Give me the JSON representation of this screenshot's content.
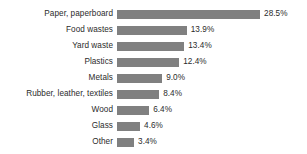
{
  "chart_data": {
    "type": "bar",
    "orientation": "horizontal",
    "title": "",
    "subtitle": "",
    "xlabel": "",
    "ylabel": "",
    "grid": false,
    "legend": null,
    "axis_visible": false,
    "xlim": [
      0,
      28.5
    ],
    "unit": "%",
    "bar_color": "#808080",
    "text_color": "#2b2b2b",
    "background": "#ffffff",
    "categories": [
      "Paper, paperboard",
      "Food wastes",
      "Yard waste",
      "Plastics",
      "Metals",
      "Rubber, leather, textiles",
      "Wood",
      "Glass",
      "Other"
    ],
    "values": [
      28.5,
      13.9,
      13.4,
      12.4,
      9.0,
      8.4,
      6.4,
      4.6,
      3.4
    ],
    "value_labels": [
      "28.5%",
      "13.9%",
      "13.4%",
      "12.4%",
      "9.0%",
      "8.4%",
      "6.4%",
      "4.6%",
      "3.4%"
    ],
    "bars": [
      {
        "label": "Paper, paperboard",
        "value": 28.5,
        "value_label": "28.5%"
      },
      {
        "label": "Food wastes",
        "value": 13.9,
        "value_label": "13.9%"
      },
      {
        "label": "Yard waste",
        "value": 13.4,
        "value_label": "13.4%"
      },
      {
        "label": "Plastics",
        "value": 12.4,
        "value_label": "12.4%"
      },
      {
        "label": "Metals",
        "value": 9.0,
        "value_label": "9.0%"
      },
      {
        "label": "Rubber, leather, textiles",
        "value": 8.4,
        "value_label": "8.4%"
      },
      {
        "label": "Wood",
        "value": 6.4,
        "value_label": "6.4%"
      },
      {
        "label": "Glass",
        "value": 4.6,
        "value_label": "4.6%"
      },
      {
        "label": "Other",
        "value": 3.4,
        "value_label": "3.4%"
      }
    ]
  }
}
